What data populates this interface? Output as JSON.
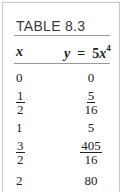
{
  "table": {
    "title": "TABLE 8.3",
    "headers": {
      "x": "x",
      "y_lhs": "y",
      "y_eq": "=",
      "y_coef": "5",
      "y_var": "x",
      "y_exp": "4"
    },
    "rows": [
      {
        "x": "0",
        "y": "0"
      },
      {
        "x_num": "1",
        "x_den": "2",
        "y_num": "5",
        "y_den": "16"
      },
      {
        "x": "1",
        "y": "5"
      },
      {
        "x_num": "3",
        "x_den": "2",
        "y_num": "405",
        "y_den": "16"
      },
      {
        "x": "2",
        "y": "80"
      }
    ]
  }
}
